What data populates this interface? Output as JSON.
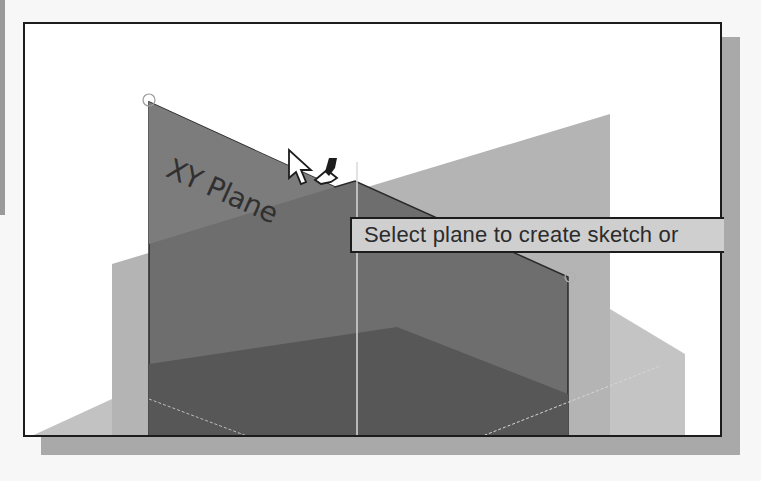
{
  "viewport": {
    "planes": [
      {
        "name": "XY Plane",
        "label": "XY Plane",
        "shade": "#6e6e6e"
      },
      {
        "name": "YZ Plane",
        "label": "",
        "shade": "#b4b4b4"
      },
      {
        "name": "ZX Plane",
        "label": "",
        "shade": "#5a5a5a"
      }
    ],
    "colors": {
      "background": "#ffffff",
      "frame": "#1c1c1c",
      "shadow": "#a9a9a9",
      "tooltip_bg": "#cfcfcf"
    }
  },
  "xy_plane": {
    "label": "XY Plane"
  },
  "tooltip": {
    "text": "Select plane to create sketch or"
  },
  "cursor": {
    "icon": "arrow-with-sketch-pencil-icon"
  }
}
